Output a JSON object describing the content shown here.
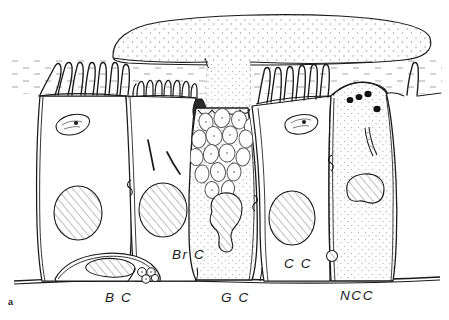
{
  "figure": {
    "panel_letter": "a",
    "caption_note": "",
    "background_color": "#ffffff",
    "ink_color": "#1a1a1a",
    "stipple_color": "#8a8a8a",
    "hatch_color": "#6e6e6e"
  },
  "labels": [
    {
      "id": "bc",
      "text": "B C",
      "x": 105,
      "y": 302,
      "name": "label-basal-cell"
    },
    {
      "id": "brc",
      "text": "Br C",
      "x": 172,
      "y": 259,
      "name": "label-brush-cell"
    },
    {
      "id": "gc",
      "text": "G C",
      "x": 221,
      "y": 302,
      "name": "label-goblet-cell"
    },
    {
      "id": "cc",
      "text": "C C",
      "x": 284,
      "y": 268,
      "name": "label-ciliated-cell"
    },
    {
      "id": "ncc",
      "text": "NCC",
      "x": 340,
      "y": 300,
      "name": "label-nonciliated-cell"
    }
  ],
  "structures": {
    "mucus_blob": "apical-mucus-layer",
    "periciliary_layer": "periciliary-fluid-layer",
    "basal_lamina": "basal-lamina",
    "cilia": "cilia-tuft",
    "microvilli": "microvilli-brush-border",
    "mucus_granules": "mucus-granule-cluster",
    "dark_granules": "dense-apical-granules",
    "junction": "junctional-complex",
    "mitochondrion": "mitochondrion",
    "nucleus": "nucleus"
  },
  "cells": [
    {
      "id": "cell1",
      "name": "ciliated-cell-left",
      "apex": "cilia",
      "nucleus": "oval-hatched",
      "organelles": [
        "mitochondrion"
      ]
    },
    {
      "id": "brc",
      "name": "brush-cell",
      "apex": "microvilli",
      "nucleus": "oval-hatched",
      "organelles": [
        "filaments"
      ]
    },
    {
      "id": "gc",
      "name": "goblet-cell",
      "apex": "secreting",
      "nucleus": "lobed-hatched",
      "organelles": [
        "mucus-granules"
      ]
    },
    {
      "id": "cc",
      "name": "ciliated-cell-right",
      "apex": "cilia",
      "nucleus": "oval-hatched",
      "organelles": [
        "mitochondrion"
      ]
    },
    {
      "id": "ncc",
      "name": "non-ciliated-cell",
      "apex": "smooth",
      "nucleus": "indented-hatched",
      "organelles": [
        "dense-granules",
        "filament"
      ]
    },
    {
      "id": "bc",
      "name": "basal-cell",
      "apex": "none",
      "nucleus": "flattened-hatched",
      "organelles": [
        "vesicle-cluster"
      ]
    }
  ]
}
